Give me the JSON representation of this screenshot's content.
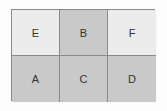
{
  "diagram": {
    "rows": [
      [
        {
          "label": "E",
          "shade": "light"
        },
        {
          "label": "B",
          "shade": "dark"
        },
        {
          "label": "F",
          "shade": "light"
        }
      ],
      [
        {
          "label": "A",
          "shade": "dark"
        },
        {
          "label": "C",
          "shade": "dark"
        },
        {
          "label": "D",
          "shade": "dark"
        }
      ]
    ],
    "colors": {
      "light": "#ececec",
      "dark": "#c9c9c9",
      "border": "#8a8a8a"
    }
  }
}
